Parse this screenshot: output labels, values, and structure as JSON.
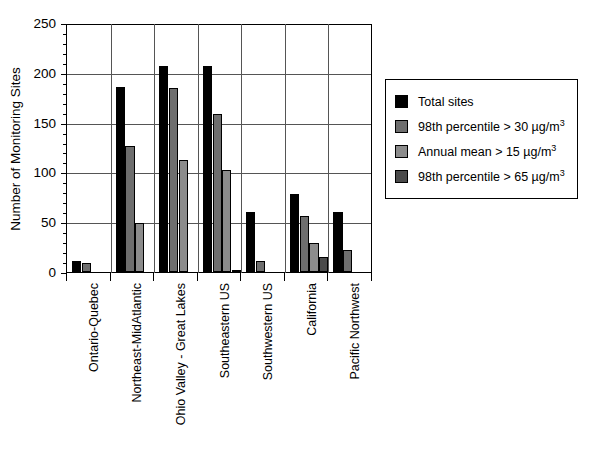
{
  "chart_data": {
    "type": "bar",
    "title": "",
    "xlabel": "",
    "ylabel": "Number of Monitoring Sites",
    "ylim": [
      0,
      250
    ],
    "ytick_labels": [
      "0",
      "50",
      "100",
      "150",
      "200",
      "250"
    ],
    "ytick_values": [
      0,
      50,
      100,
      150,
      200,
      250
    ],
    "minor_tick_step": 10,
    "grid": "horizontal-and-vertical",
    "legend_position": "right",
    "categories": [
      "Ontario-Quebec",
      "Northeast-MidAtlantic",
      "Ohio Valley - Great Lakes",
      "Southeastern US",
      "Southwestern US",
      "California",
      "Pacific Northwest"
    ],
    "series": [
      {
        "name": "Total sites",
        "color": "#000000",
        "values": [
          11,
          186,
          207,
          207,
          60,
          78,
          60
        ]
      },
      {
        "name": "98th percentile > 30 µg/m3",
        "color": "#6e6e6e",
        "values": [
          9,
          127,
          185,
          159,
          11,
          56,
          22
        ]
      },
      {
        "name": "Annual mean > 15 µg/m3",
        "color": "#8c8c8c",
        "values": [
          0,
          49,
          112,
          102,
          0,
          29,
          0
        ]
      },
      {
        "name": "98th percentile > 65 µg/m3",
        "color": "#4a4a4a",
        "values": [
          0,
          0,
          0,
          2,
          0,
          15,
          0
        ]
      }
    ]
  },
  "legend": {
    "entries": [
      {
        "label": "Total sites",
        "sup": "",
        "swatch": "#000000"
      },
      {
        "label": "98th percentile > 30 µg/m",
        "sup": "3",
        "swatch": "#6e6e6e"
      },
      {
        "label": "Annual mean > 15 µg/m",
        "sup": "3",
        "swatch": "#8c8c8c"
      },
      {
        "label": "98th percentile > 65 µg/m",
        "sup": "3",
        "swatch": "#4a4a4a"
      }
    ]
  },
  "caption": {
    "text": "",
    "stray_mark": ""
  },
  "colors": {
    "axis": "#000000",
    "grid": "#555555",
    "background": "#ffffff"
  }
}
